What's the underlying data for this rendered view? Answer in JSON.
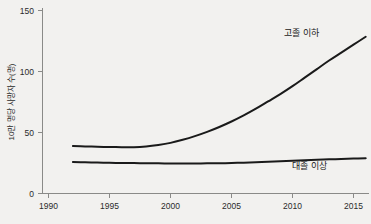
{
  "chart_data": {
    "type": "line",
    "title": "",
    "xlabel": "",
    "ylabel": "10만 명당 사망자 수(명)",
    "xlim": [
      1990,
      2016.5
    ],
    "ylim": [
      0,
      150
    ],
    "xticks": [
      "1990",
      "1995",
      "2000",
      "2005",
      "2010",
      "2015"
    ],
    "xtick_values": [
      1990,
      1995,
      2000,
      2005,
      2010,
      2015
    ],
    "yticks": [
      "0",
      "50",
      "100",
      "150"
    ],
    "ytick_values": [
      0,
      50,
      100,
      150
    ],
    "grid": false,
    "legend_position": "inline-annotation",
    "x": [
      1992,
      1993,
      1994,
      1995,
      1996,
      1997,
      1998,
      1999,
      2000,
      2001,
      2002,
      2003,
      2004,
      2005,
      2006,
      2007,
      2008,
      2009,
      2010,
      2011,
      2012,
      2013,
      2014,
      2015,
      2016
    ],
    "series": [
      {
        "name": "고졸 이하",
        "label": "고졸 이하",
        "color": "#1a1a1a",
        "values": [
          39,
          38.6,
          38.3,
          38.1,
          38.0,
          38.0,
          38.6,
          39.8,
          41.5,
          44.0,
          47.0,
          50.5,
          54.5,
          59.0,
          64.0,
          69.5,
          75.5,
          81.5,
          88.0,
          95.0,
          102.0,
          109.0,
          115.5,
          122.0,
          128.5
        ]
      },
      {
        "name": "대졸 이상",
        "label": "대졸 이상",
        "color": "#1a1a1a",
        "values": [
          25.8,
          25.6,
          25.4,
          25.2,
          25.0,
          24.9,
          24.8,
          24.7,
          24.6,
          24.6,
          24.6,
          24.7,
          24.8,
          25.0,
          25.3,
          25.6,
          26.0,
          26.4,
          26.8,
          27.2,
          27.6,
          28.0,
          28.3,
          28.6,
          28.9
        ]
      }
    ],
    "annotations": [
      {
        "text": "고졸 이하",
        "x_px": 284,
        "y_px": 36
      },
      {
        "text": "대졸 이상",
        "x_px": 292,
        "y_px": 169
      }
    ]
  }
}
